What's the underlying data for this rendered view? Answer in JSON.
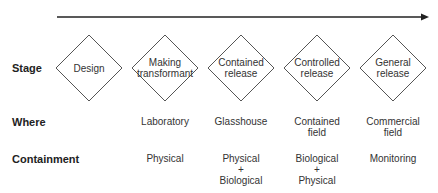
{
  "diagram": {
    "arrow": {
      "direction": "right",
      "color": "#222222"
    },
    "row_labels": {
      "stage": "Stage",
      "where": "Where",
      "containment": "Containment"
    },
    "stages": [
      {
        "stage": "Design",
        "where": "",
        "containment": ""
      },
      {
        "stage_line1": "Making",
        "stage_line2": "transformant",
        "where": "Laboratory",
        "containment": "Physical"
      },
      {
        "stage_line1": "Contained",
        "stage_line2": "release",
        "where": "Glasshouse",
        "containment_line1": "Physical",
        "containment_plus": "+",
        "containment_line2": "Biological"
      },
      {
        "stage_line1": "Controlled",
        "stage_line2": "release",
        "where_line1": "Contained",
        "where_line2": "field",
        "containment_line1": "Biological",
        "containment_plus": "+",
        "containment_line2": "Physical"
      },
      {
        "stage_line1": "General",
        "stage_line2": "release",
        "where_line1": "Commercial",
        "where_line2": "field",
        "containment": "Monitoring"
      }
    ]
  }
}
